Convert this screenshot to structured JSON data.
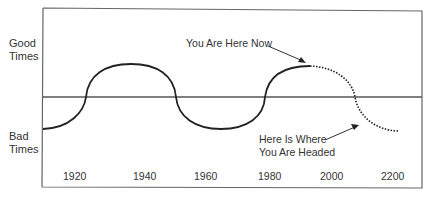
{
  "diagram": {
    "y_labels": {
      "top": [
        "Good",
        "Times"
      ],
      "bottom": [
        "Bad",
        "Times"
      ]
    },
    "x_ticks": [
      "1920",
      "1940",
      "1960",
      "1980",
      "2000",
      "2200"
    ],
    "annotations": {
      "now": "You Are Here Now",
      "headed": [
        "Here Is Where",
        "You Are Headed"
      ]
    },
    "colors": {
      "line": "#222222",
      "frame": "#555555"
    }
  }
}
